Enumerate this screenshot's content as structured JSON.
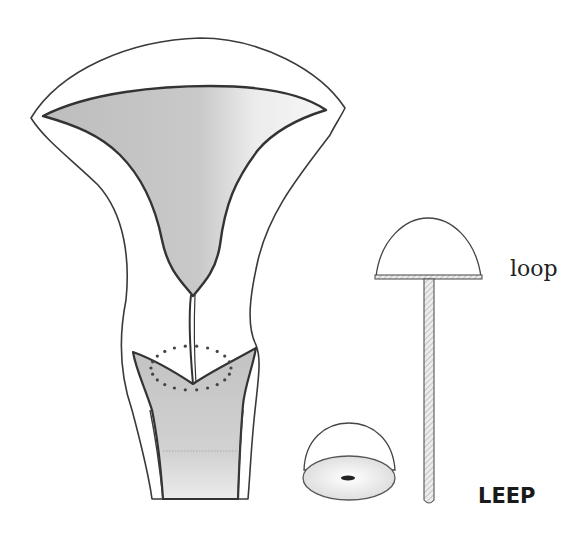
{
  "figure": {
    "labels": {
      "loop": "loop",
      "procedure": "LEEP"
    },
    "colors": {
      "outline": "#3a3a3a",
      "shading": "#c8c8c8",
      "background": "#ffffff",
      "text": "#1a1a1a"
    },
    "parts": [
      {
        "name": "uterus-outer-wall"
      },
      {
        "name": "uterine-cavity"
      },
      {
        "name": "cervical-canal"
      },
      {
        "name": "cervix-vagina"
      },
      {
        "name": "excision-zone-dotted"
      },
      {
        "name": "loop-electrode"
      },
      {
        "name": "cone-specimen"
      }
    ]
  }
}
